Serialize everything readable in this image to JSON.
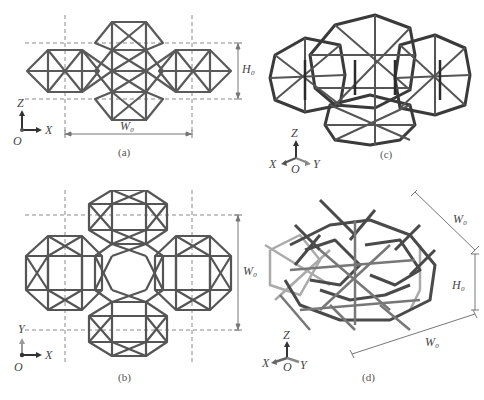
{
  "figure": {
    "panels": [
      {
        "id": "a",
        "label": "(a)",
        "view": "front view (X-Z plane)",
        "dim_width": "W₀",
        "dim_height": "H₀",
        "axes": {
          "vertical": "Z",
          "horizontal": "X",
          "origin": "O"
        }
      },
      {
        "id": "b",
        "label": "(b)",
        "view": "top view (X-Y plane)",
        "dim_width": "W₀",
        "axes": {
          "vertical": "Y",
          "horizontal": "X",
          "origin": "O"
        }
      },
      {
        "id": "c",
        "label": "(c)",
        "view": "isometric solid lattice",
        "axes": {
          "vertical": "Z",
          "left": "X",
          "right": "Y",
          "origin": "O"
        }
      },
      {
        "id": "d",
        "label": "(d)",
        "view": "isometric unit cell",
        "dim_width_1": "W₀",
        "dim_width_2": "W₀",
        "dim_height": "H₀",
        "axes": {
          "vertical": "Z",
          "left": "X",
          "right": "Y",
          "origin": "O"
        }
      }
    ],
    "caption": ""
  },
  "colors": {
    "strut_dark": "#3a3a3a",
    "strut_mid": "#6b6b6b",
    "strut_light": "#9a9a9a",
    "dashed_guide": "#8a8a8a",
    "dimension_line": "#777777",
    "background": "#ffffff"
  }
}
